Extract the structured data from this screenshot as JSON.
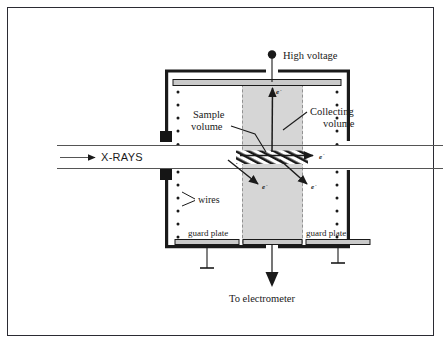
{
  "figure": {
    "background_color": "#ffffff",
    "border_color": "#2b2b33",
    "ink_color": "#1a1a1a",
    "collecting_volume_fill": "#d6d6d6",
    "plate_fill": "#c9c9c9",
    "wall_color": "#1a1a1a"
  },
  "labels": {
    "high_voltage": "High voltage",
    "sample_volume_line1": "Sample",
    "sample_volume_line2": "volume",
    "collecting_volume_line1": "Collecting",
    "collecting_volume_line2": "volume",
    "xrays": "X-RAYS",
    "wires": "wires",
    "guard_plate_left": "guard plate",
    "guard_plate_right": "guard plate",
    "to_electrometer": "To electrometer",
    "electron_up": "e",
    "electron_right": "e",
    "electron_down_left": "e",
    "electron_down_right": "e",
    "electron_charge_sign": "-"
  },
  "components": {
    "chamber_wall": "chamber-wall",
    "hv_electrode_plate": "high-voltage-electrode-plate",
    "hv_terminal": "high-voltage-terminal-dot",
    "collector_plate": "collector-plate",
    "guard_plates": 2,
    "ground_symbols": 2,
    "wire_columns": 2,
    "wires_per_column_upper": 5,
    "wires_per_column_lower": 5,
    "collimator_blocks": 2,
    "sample_volume_pattern": "diagonal-hatch",
    "beam_direction": "left-to-right"
  },
  "icons": {
    "hv_terminal": "filled-circle-terminal",
    "ground": "ground-symbol",
    "xray_arrow": "right-arrow-solid",
    "electrometer_arrow": "down-arrow-solid",
    "wire": "dot-marker"
  }
}
